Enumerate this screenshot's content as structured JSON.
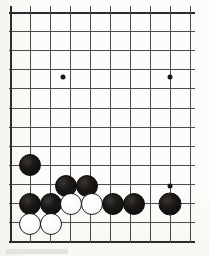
{
  "diagram": {
    "kind": "go-board-diagram",
    "board": {
      "origin_x": 10,
      "origin_y": 12,
      "cols": 10,
      "rows": 13,
      "col_spacing": 20,
      "row_spacing": 19.1,
      "line_color": "#4a4a4a",
      "edge_color": "#2b2b2b",
      "background_color": "#fdfcfa"
    },
    "star_points": [
      {
        "name": "star-point-upper-left",
        "x": 63,
        "y": 77
      },
      {
        "name": "star-point-upper-right",
        "x": 170,
        "y": 77
      },
      {
        "name": "star-point-lower-right",
        "x": 170,
        "y": 186
      }
    ],
    "stones": [
      {
        "name": "black-stone-1",
        "color": "black",
        "x": 30,
        "y": 165,
        "d": 22
      },
      {
        "name": "black-stone-2",
        "color": "black",
        "x": 66,
        "y": 186,
        "d": 22
      },
      {
        "name": "black-stone-3",
        "color": "black",
        "x": 87,
        "y": 186,
        "d": 22
      },
      {
        "name": "black-stone-4",
        "color": "black",
        "x": 30,
        "y": 204,
        "d": 22
      },
      {
        "name": "black-stone-5",
        "color": "black",
        "x": 51,
        "y": 204,
        "d": 22
      },
      {
        "name": "white-stone-1",
        "color": "white",
        "x": 71,
        "y": 204,
        "d": 22
      },
      {
        "name": "white-stone-2",
        "color": "white",
        "x": 92,
        "y": 204,
        "d": 22
      },
      {
        "name": "black-stone-6",
        "color": "black",
        "x": 113,
        "y": 204,
        "d": 22
      },
      {
        "name": "black-stone-7",
        "color": "black",
        "x": 134,
        "y": 204,
        "d": 22
      },
      {
        "name": "black-stone-8",
        "color": "black",
        "x": 170,
        "y": 204,
        "d": 23
      },
      {
        "name": "white-stone-3",
        "color": "white",
        "x": 30,
        "y": 224,
        "d": 22
      },
      {
        "name": "white-stone-4",
        "color": "white",
        "x": 51,
        "y": 224,
        "d": 22
      }
    ]
  }
}
